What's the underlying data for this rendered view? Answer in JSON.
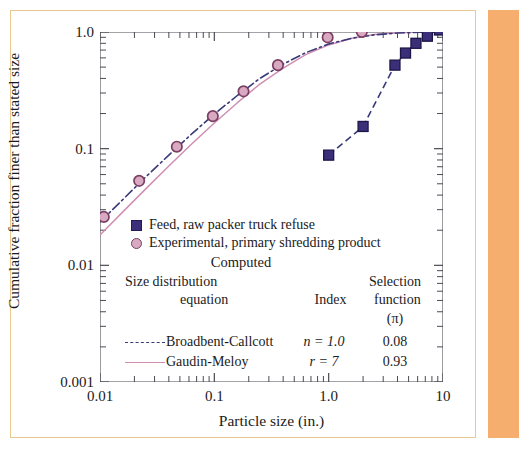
{
  "figure": {
    "border_color": "#e8c98e",
    "band_color": "#f5ae6d"
  },
  "chart_data": {
    "type": "scatter",
    "title": "",
    "xlabel": "Particle size (in.)",
    "ylabel": "Cumulative fraction finer than stated size",
    "xscale": "log",
    "yscale": "log",
    "xlim": [
      0.01,
      10
    ],
    "ylim": [
      0.001,
      1.0
    ],
    "xticks": [
      "0.01",
      "0.1",
      "1.0",
      "10"
    ],
    "xtick_values": [
      0.01,
      0.1,
      1.0,
      10
    ],
    "yticks": [
      "1.0",
      "0.1",
      "0.01",
      "0.001"
    ],
    "ytick_values": [
      1.0,
      0.1,
      0.01,
      0.001
    ],
    "grid": false,
    "legend_position": "center-left inside axes",
    "series": [
      {
        "name": "Feed, raw packer truck refuse",
        "marker": "square",
        "marker_color": "#3a2f78",
        "line": "dashed",
        "line_color": "#3a3a78",
        "x": [
          1.0,
          2.0,
          3.8,
          4.7,
          5.8,
          7.3,
          9.3
        ],
        "y": [
          0.088,
          0.155,
          0.52,
          0.66,
          0.8,
          0.92,
          1.04
        ]
      },
      {
        "name": "Experimental, primary shredding product",
        "marker": "circle",
        "marker_color": "#d8a9c0",
        "marker_edge": "#7a3f63",
        "line": "none",
        "x": [
          0.0108,
          0.022,
          0.047,
          0.097,
          0.18,
          0.36,
          0.98,
          1.95
        ],
        "y": [
          0.026,
          0.053,
          0.104,
          0.19,
          0.31,
          0.52,
          0.9,
          1.0
        ]
      },
      {
        "name": "Broadbent-Callcott",
        "marker": "none",
        "line": "dash-dot",
        "line_color": "#3a3a78",
        "x": [
          0.01,
          0.016,
          0.025,
          0.04,
          0.063,
          0.1,
          0.16,
          0.25,
          0.4,
          0.63,
          1.0,
          1.6,
          2.5,
          4.0,
          6.3,
          10.0
        ],
        "y": [
          0.0235,
          0.037,
          0.057,
          0.088,
          0.133,
          0.198,
          0.287,
          0.4,
          0.53,
          0.665,
          0.79,
          0.885,
          0.945,
          0.98,
          0.995,
          1.0
        ]
      },
      {
        "name": "Gaudin-Meloy",
        "marker": "none",
        "line": "solid",
        "line_color": "#cf8fb2",
        "x": [
          0.01,
          0.016,
          0.025,
          0.04,
          0.063,
          0.1,
          0.16,
          0.25,
          0.4,
          0.63,
          1.0,
          1.6,
          2.5,
          4.0,
          6.3,
          10.0
        ],
        "y": [
          0.0182,
          0.029,
          0.045,
          0.071,
          0.109,
          0.166,
          0.249,
          0.358,
          0.49,
          0.64,
          0.775,
          0.885,
          0.952,
          0.985,
          0.998,
          1.0
        ]
      }
    ]
  },
  "legend": {
    "entry_feed": "Feed, raw packer truck refuse",
    "entry_experimental": "Experimental, primary shredding product",
    "computed_header": "Computed",
    "col_equation_l1": "Size distribution",
    "col_equation_l2": "equation",
    "col_index": "Index",
    "col_selection_l1": "Selection",
    "col_selection_l2": "function",
    "col_selection_l3": "(π)",
    "rows": [
      {
        "name": "Broadbent-Callcott",
        "index": "n = 1.0",
        "selection": "0.08",
        "style": "dash"
      },
      {
        "name": "Gaudin-Meloy",
        "index": "r = 7",
        "selection": "0.93",
        "style": "solid"
      }
    ]
  },
  "axes": {
    "x_title": "Particle size (in.)",
    "y_title": "Cumulative fraction finer than stated size",
    "x_tick_labels": [
      "0.01",
      "0.1",
      "1.0",
      "10"
    ],
    "y_tick_labels": [
      "1.0",
      "0.1",
      "0.01",
      "0.001"
    ]
  }
}
